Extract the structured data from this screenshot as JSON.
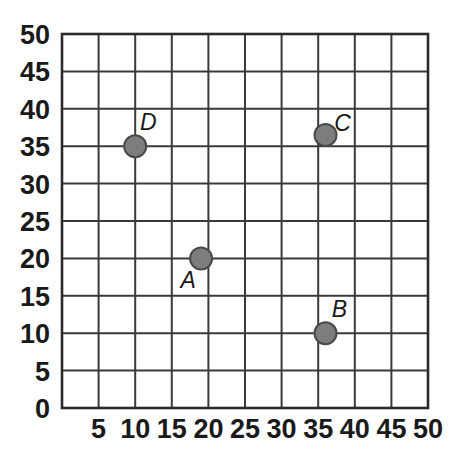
{
  "chart_data": {
    "type": "scatter",
    "title": "",
    "xlabel": "",
    "ylabel": "",
    "xlim": [
      0,
      50
    ],
    "ylim": [
      0,
      50
    ],
    "xticks": [
      0,
      5,
      10,
      15,
      20,
      25,
      30,
      35,
      40,
      45,
      50
    ],
    "yticks": [
      0,
      5,
      10,
      15,
      20,
      25,
      30,
      35,
      40,
      45,
      50
    ],
    "xtick_labels": [
      "0",
      "5",
      "10",
      "15",
      "20",
      "25",
      "30",
      "35",
      "40",
      "45",
      "50"
    ],
    "ytick_labels": [
      "0",
      "5",
      "10",
      "15",
      "20",
      "25",
      "30",
      "35",
      "40",
      "45",
      "50"
    ],
    "grid": true,
    "grid_step": 5,
    "legend": null,
    "point_color": "#7d7d7d",
    "point_edge_color": "#4a4a4a",
    "grid_color": "#3a3a3a",
    "points": [
      {
        "label": "A",
        "x": 19,
        "y": 20,
        "label_dx": -13,
        "label_dy": 30
      },
      {
        "label": "B",
        "x": 36,
        "y": 10,
        "label_dx": 14,
        "label_dy": -16
      },
      {
        "label": "C",
        "x": 36,
        "y": 36.5,
        "label_dx": 17,
        "label_dy": -4
      },
      {
        "label": "D",
        "x": 10,
        "y": 35,
        "label_dx": 13,
        "label_dy": -16
      }
    ]
  }
}
